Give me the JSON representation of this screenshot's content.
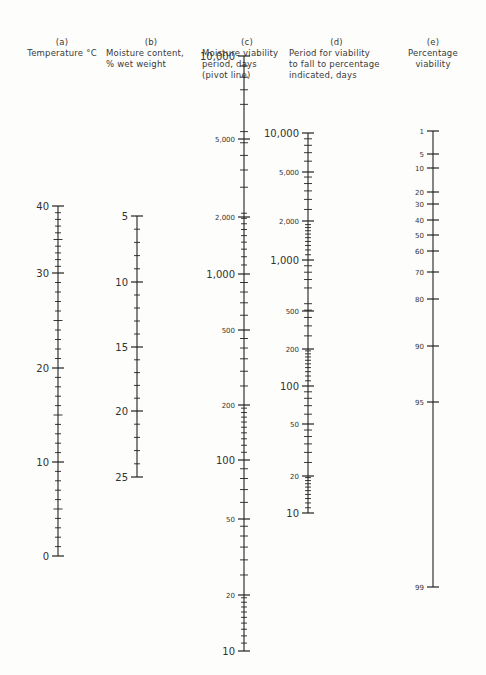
{
  "page_marker": "-5U-",
  "scales": [
    {
      "id": "a",
      "letter": "(a)",
      "title_lines": [
        "Temperature °C"
      ],
      "x": 58,
      "header": {
        "left": 22,
        "top": 37,
        "width": 80,
        "align": "center"
      },
      "major": [
        {
          "v": "40",
          "y": 206
        },
        {
          "v": "30",
          "y": 273
        },
        {
          "v": "20",
          "y": 368
        },
        {
          "v": "10",
          "y": 462
        },
        {
          "v": "0",
          "y": 556
        }
      ],
      "minor_between": 9,
      "label_size": 10
    },
    {
      "id": "b",
      "letter": "(b)",
      "title_lines": [
        "Moisture content,",
        "% wet weight"
      ],
      "x": 137,
      "header": {
        "left": 106,
        "top": 37,
        "width": 90,
        "align": "left"
      },
      "major": [
        {
          "v": "5",
          "y": 216
        },
        {
          "v": "10",
          "y": 282
        },
        {
          "v": "15",
          "y": 347
        },
        {
          "v": "20",
          "y": 411
        },
        {
          "v": "25",
          "y": 477
        }
      ],
      "minor_between": 4,
      "label_size": 10
    },
    {
      "id": "c",
      "letter": "(c)",
      "title_lines": [
        "Moisture viability",
        "period, days",
        "(pivot line)"
      ],
      "x": 244,
      "header": {
        "left": 202,
        "top": 37,
        "width": 90,
        "align": "left"
      },
      "major": [
        {
          "v": "10,000",
          "y": 56,
          "size": 10
        },
        {
          "v": "5,000",
          "y": 139,
          "size": 7
        },
        {
          "v": "2,000",
          "y": 217,
          "size": 7
        },
        {
          "v": "1,000",
          "y": 274,
          "size": 10
        },
        {
          "v": "500",
          "y": 330,
          "size": 7
        },
        {
          "v": "200",
          "y": 405,
          "size": 7
        },
        {
          "v": "100",
          "y": 460,
          "size": 10
        },
        {
          "v": "50",
          "y": 519,
          "size": 7
        },
        {
          "v": "20",
          "y": 595,
          "size": 7
        },
        {
          "v": "10",
          "y": 651,
          "size": 10
        }
      ],
      "log_decades": [
        [
          56,
          274
        ],
        [
          274,
          460
        ],
        [
          460,
          651
        ]
      ]
    },
    {
      "id": "d",
      "letter": "(d)",
      "title_lines": [
        "Period for viability",
        "to fall to percentage",
        "indicated, days"
      ],
      "x": 308,
      "header": {
        "left": 289,
        "top": 37,
        "width": 95,
        "align": "left"
      },
      "major": [
        {
          "v": "10,000",
          "y": 133,
          "size": 10
        },
        {
          "v": "5,000",
          "y": 172,
          "size": 7
        },
        {
          "v": "2,000",
          "y": 221,
          "size": 7
        },
        {
          "v": "1,000",
          "y": 260,
          "size": 10
        },
        {
          "v": "500",
          "y": 311,
          "size": 7
        },
        {
          "v": "200",
          "y": 349,
          "size": 7
        },
        {
          "v": "100",
          "y": 386,
          "size": 10
        },
        {
          "v": "50",
          "y": 424,
          "size": 7
        },
        {
          "v": "20",
          "y": 476,
          "size": 7
        },
        {
          "v": "10",
          "y": 513,
          "size": 10
        }
      ],
      "log_decades": [
        [
          133,
          260
        ],
        [
          260,
          386
        ],
        [
          386,
          513
        ]
      ]
    },
    {
      "id": "e",
      "letter": "(e)",
      "title_lines": [
        "Percentage",
        "viability"
      ],
      "x": 433,
      "header": {
        "left": 400,
        "top": 37,
        "width": 66,
        "align": "center"
      },
      "major": [
        {
          "v": "1",
          "y": 131
        },
        {
          "v": "5",
          "y": 154
        },
        {
          "v": "10",
          "y": 168
        },
        {
          "v": "20",
          "y": 192
        },
        {
          "v": "30",
          "y": 204
        },
        {
          "v": "40",
          "y": 220
        },
        {
          "v": "50",
          "y": 235
        },
        {
          "v": "60",
          "y": 251
        },
        {
          "v": "70",
          "y": 272
        },
        {
          "v": "80",
          "y": 299
        },
        {
          "v": "90",
          "y": 346
        },
        {
          "v": "95",
          "y": 402
        },
        {
          "v": "99",
          "y": 587
        }
      ],
      "label_size": 7
    }
  ]
}
